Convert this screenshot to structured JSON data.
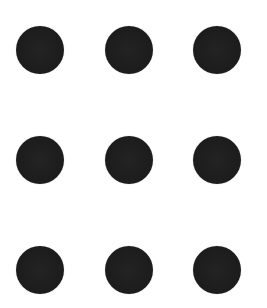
{
  "grid": {
    "rows": 3,
    "columns": 3,
    "dot_color": "#1e1e1e",
    "background": "#ffffff",
    "dots": [
      {
        "row": 1,
        "col": 1,
        "x": 40,
        "y": 50
      },
      {
        "row": 1,
        "col": 2,
        "x": 129,
        "y": 50
      },
      {
        "row": 1,
        "col": 3,
        "x": 217,
        "y": 50
      },
      {
        "row": 2,
        "col": 1,
        "x": 40,
        "y": 160
      },
      {
        "row": 2,
        "col": 2,
        "x": 129,
        "y": 160
      },
      {
        "row": 2,
        "col": 3,
        "x": 217,
        "y": 160
      },
      {
        "row": 3,
        "col": 1,
        "x": 40,
        "y": 270
      },
      {
        "row": 3,
        "col": 2,
        "x": 129,
        "y": 270
      },
      {
        "row": 3,
        "col": 3,
        "x": 217,
        "y": 270
      }
    ]
  }
}
